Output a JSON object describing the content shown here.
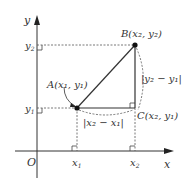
{
  "diagram": {
    "type": "coordinate-geometry",
    "axes": {
      "x_label": "x",
      "y_label": "y",
      "origin_label": "O"
    },
    "ticks": {
      "x1": "x",
      "x1_sub": "1",
      "x2": "x",
      "x2_sub": "2",
      "y1": "y",
      "y1_sub": "1",
      "y2": "y",
      "y2_sub": "2"
    },
    "points": {
      "A": {
        "name": "A",
        "label": "A(x₁, y₁)"
      },
      "B": {
        "name": "B",
        "label": "B(x₂, y₂)"
      },
      "C": {
        "name": "C",
        "label": "C(x₂, y₁)"
      }
    },
    "side_labels": {
      "horizontal": "|x₂ − x₁|",
      "vertical": "|y₂ − y₁|"
    },
    "colors": {
      "line": "#333333",
      "dashed": "#555555",
      "point": "#111111"
    }
  }
}
